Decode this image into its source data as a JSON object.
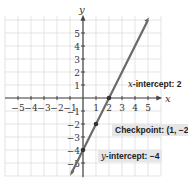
{
  "chart_data": {
    "type": "line",
    "title": "",
    "xlabel": "x",
    "ylabel": "y",
    "xlim": [
      -5.5,
      5.5
    ],
    "ylim": [
      -5.5,
      6
    ],
    "grid": true,
    "x_ticks": [
      -5,
      -4,
      -3,
      -2,
      -1,
      1,
      2,
      3,
      4,
      5
    ],
    "y_ticks": [
      -5,
      -4,
      -3,
      -2,
      -1,
      1,
      2,
      3,
      4,
      5
    ],
    "series": [
      {
        "name": "line",
        "equation": "y = 2x - 4",
        "slope": 2,
        "intercept": -4,
        "x": [
          -0.9,
          5
        ],
        "y": [
          -5.8,
          6
        ]
      }
    ],
    "points": [
      {
        "label": "x-intercept",
        "x": 2,
        "y": 0
      },
      {
        "label": "Checkpoint",
        "x": 1,
        "y": -2
      },
      {
        "label": "y-intercept",
        "x": 0,
        "y": -4
      }
    ],
    "annotations": [
      {
        "text": "x-intercept: 2"
      },
      {
        "text": "Checkpoint: (1, −2)"
      },
      {
        "text": "y-intercept: −4"
      }
    ]
  },
  "labels": {
    "x_axis": "x",
    "y_axis": "y",
    "x_intercept_var": "x",
    "x_intercept_text": "-intercept: 2",
    "checkpoint_text": "Checkpoint: (1, −2)",
    "y_intercept_var": "y",
    "y_intercept_text": "-intercept: −4"
  }
}
